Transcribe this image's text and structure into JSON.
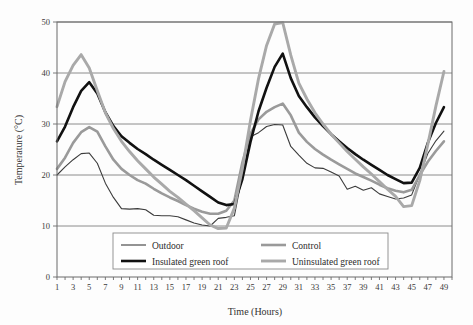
{
  "chart_data": {
    "type": "line",
    "title": "",
    "xlabel": "Time (Hours)",
    "ylabel": "Temperature (°C)",
    "xlim": [
      1,
      50
    ],
    "ylim": [
      0,
      50
    ],
    "yticks": [
      0,
      10,
      20,
      30,
      40,
      50
    ],
    "xticks": [
      1,
      3,
      5,
      7,
      9,
      11,
      13,
      15,
      17,
      19,
      21,
      23,
      25,
      27,
      29,
      31,
      33,
      35,
      37,
      39,
      41,
      43,
      45,
      47,
      49
    ],
    "grid": "horizontal",
    "legend_position": "bottom-center",
    "x": [
      1,
      2,
      3,
      4,
      5,
      6,
      7,
      8,
      9,
      10,
      11,
      12,
      13,
      14,
      15,
      16,
      17,
      18,
      19,
      20,
      21,
      22,
      23,
      24,
      25,
      26,
      27,
      28,
      29,
      30,
      31,
      32,
      33,
      34,
      35,
      36,
      37,
      38,
      39,
      40,
      41,
      42,
      43,
      44,
      45,
      46,
      47,
      48,
      49
    ],
    "series": [
      {
        "name": "Outdoor",
        "color": "#3c3c3c",
        "width": 1.1,
        "values": [
          20.0,
          21.6,
          23.0,
          24.2,
          24.3,
          22.3,
          18.4,
          15.6,
          13.4,
          13.3,
          13.4,
          13.2,
          12.1,
          12.0,
          12.0,
          11.8,
          11.2,
          10.6,
          10.2,
          10.0,
          11.5,
          11.7,
          12.0,
          20.0,
          27.5,
          28.3,
          29.5,
          29.9,
          29.8,
          25.6,
          23.9,
          22.3,
          21.4,
          21.3,
          20.6,
          19.8,
          17.2,
          17.8,
          17.0,
          17.5,
          16.3,
          15.8,
          15.3,
          15.5,
          16.1,
          20.1,
          24.2,
          26.7,
          28.6
        ]
      },
      {
        "name": "Control",
        "color": "#9a9a9a",
        "width": 2.6,
        "values": [
          21.2,
          23.4,
          26.3,
          28.4,
          29.4,
          28.5,
          25.6,
          23.0,
          21.2,
          20.0,
          19.0,
          18.3,
          17.3,
          16.4,
          15.6,
          14.9,
          14.1,
          13.4,
          12.8,
          12.4,
          12.4,
          13.0,
          15.0,
          22.5,
          28.1,
          30.9,
          32.4,
          33.3,
          34.0,
          31.7,
          28.3,
          26.5,
          25.1,
          24.0,
          23.0,
          22.1,
          21.2,
          20.3,
          19.6,
          18.9,
          18.1,
          17.4,
          16.9,
          16.6,
          17.1,
          20.0,
          22.6,
          24.7,
          26.6
        ]
      },
      {
        "name": "Insulated green roof",
        "color": "#111111",
        "width": 2.6,
        "values": [
          26.6,
          29.5,
          33.3,
          36.5,
          38.2,
          36.0,
          32.3,
          29.6,
          27.6,
          26.3,
          25.1,
          24.1,
          23.0,
          22.0,
          21.0,
          20.0,
          19.0,
          17.9,
          16.8,
          15.7,
          14.6,
          14.1,
          14.3,
          19.2,
          26.5,
          32.5,
          37.1,
          41.2,
          43.8,
          39.0,
          35.5,
          33.3,
          31.3,
          29.6,
          28.0,
          26.6,
          25.3,
          24.1,
          23.0,
          22.0,
          21.0,
          20.0,
          19.2,
          18.4,
          18.5,
          21.4,
          26.3,
          30.2,
          33.3
        ]
      },
      {
        "name": "Uninsulated green roof",
        "color": "#a9a9a9",
        "width": 2.9,
        "values": [
          33.4,
          38.3,
          41.5,
          43.6,
          41.0,
          36.5,
          32.2,
          29.1,
          26.6,
          24.6,
          22.8,
          21.2,
          19.6,
          18.2,
          16.8,
          15.6,
          14.3,
          13.0,
          11.6,
          10.2,
          9.5,
          9.6,
          13.5,
          21.3,
          30.7,
          38.9,
          45.4,
          49.6,
          49.9,
          43.5,
          38.0,
          34.9,
          32.2,
          30.0,
          28.0,
          26.3,
          24.6,
          23.1,
          21.6,
          20.2,
          18.7,
          17.2,
          15.8,
          13.8,
          14.0,
          18.9,
          26.0,
          33.5,
          40.3
        ]
      }
    ]
  },
  "legend": {
    "entries": [
      {
        "label": "Outdoor"
      },
      {
        "label": "Control"
      },
      {
        "label": "Insulated green roof"
      },
      {
        "label": "Uninsulated green roof"
      }
    ]
  }
}
